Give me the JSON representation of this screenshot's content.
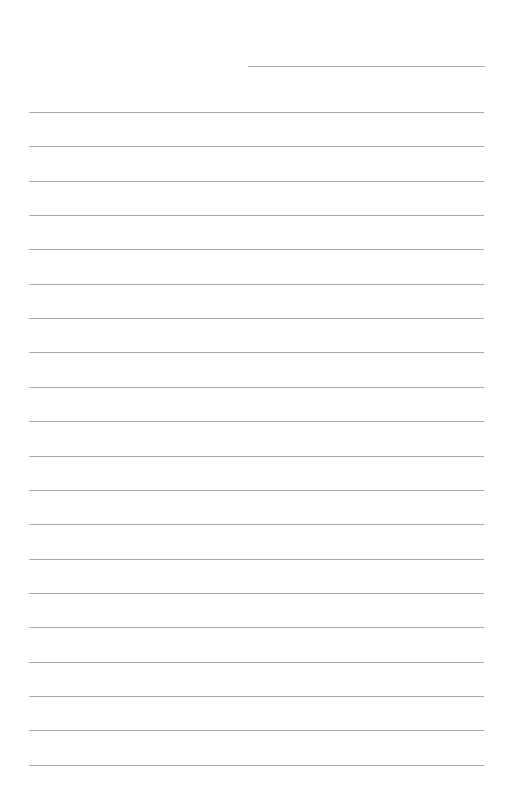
{
  "document": {
    "type": "lined-paper",
    "header_line": {
      "text": ""
    },
    "line_color": "#a9a9a9",
    "background_color": "#ffffff",
    "ruled_lines_count": 20,
    "lines": [
      "",
      "",
      "",
      "",
      "",
      "",
      "",
      "",
      "",
      "",
      "",
      "",
      "",
      "",
      "",
      "",
      "",
      "",
      "",
      ""
    ]
  }
}
